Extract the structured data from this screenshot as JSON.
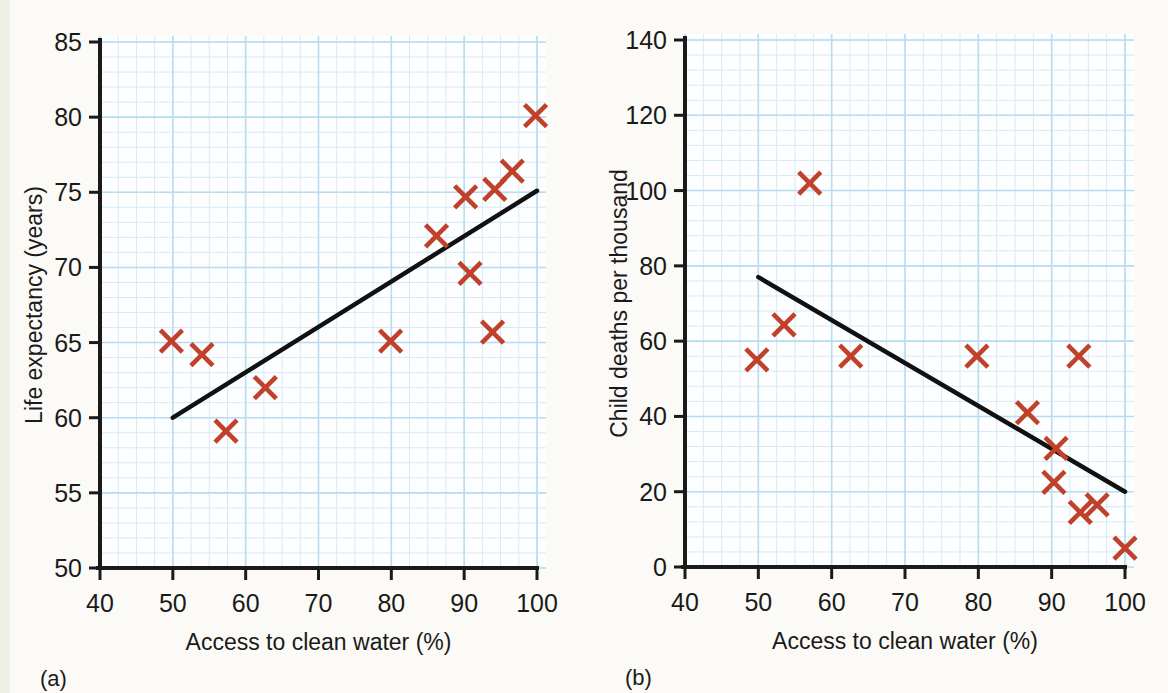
{
  "figure": {
    "background_color": "#fbfaf6",
    "marker_color": "#c0402a",
    "trendline_color": "#111111",
    "grid_minor_color": "#d8e9f4",
    "grid_major_color": "#b9dcef"
  },
  "chart_data": [
    {
      "type": "scatter",
      "panel_label": "(a)",
      "title": "",
      "xlabel": "Access to clean water (%)",
      "ylabel": "Life expectancy (years)",
      "xlim": [
        40,
        100
      ],
      "ylim": [
        50,
        85
      ],
      "xticks": [
        40,
        50,
        60,
        70,
        80,
        90,
        100
      ],
      "yticks": [
        50,
        55,
        60,
        65,
        70,
        75,
        80,
        85
      ],
      "xticklabels": [
        "40",
        "50",
        "60",
        "70",
        "80",
        "90",
        "100"
      ],
      "yticklabels": [
        "50",
        "55",
        "60",
        "65",
        "70",
        "75",
        "80",
        "85"
      ],
      "grid": true,
      "legend": "none",
      "points": [
        {
          "x": 49.8,
          "y": 65.1
        },
        {
          "x": 54.0,
          "y": 64.2
        },
        {
          "x": 57.3,
          "y": 59.1
        },
        {
          "x": 62.7,
          "y": 62.0
        },
        {
          "x": 79.9,
          "y": 65.1
        },
        {
          "x": 86.2,
          "y": 72.1
        },
        {
          "x": 90.2,
          "y": 74.7
        },
        {
          "x": 90.8,
          "y": 69.6
        },
        {
          "x": 93.9,
          "y": 65.7
        },
        {
          "x": 94.2,
          "y": 75.2
        },
        {
          "x": 96.6,
          "y": 76.4
        },
        {
          "x": 99.8,
          "y": 80.1
        }
      ],
      "trendline": {
        "x": [
          50,
          100
        ],
        "y": [
          60.0,
          75.1
        ]
      }
    },
    {
      "type": "scatter",
      "panel_label": "(b)",
      "title": "",
      "xlabel": "Access to clean water (%)",
      "ylabel": "Child deaths per thousand",
      "xlim": [
        40,
        100
      ],
      "ylim": [
        0,
        140
      ],
      "xticks": [
        40,
        50,
        60,
        70,
        80,
        90,
        100
      ],
      "yticks": [
        0,
        20,
        40,
        60,
        80,
        100,
        120,
        140
      ],
      "xticklabels": [
        "40",
        "50",
        "60",
        "70",
        "80",
        "90",
        "100"
      ],
      "yticklabels": [
        "0",
        "20",
        "40",
        "60",
        "80",
        "100",
        "120",
        "140"
      ],
      "grid": true,
      "legend": "none",
      "points": [
        {
          "x": 49.8,
          "y": 55.0
        },
        {
          "x": 53.5,
          "y": 64.3
        },
        {
          "x": 57.0,
          "y": 102.0
        },
        {
          "x": 62.6,
          "y": 56.0
        },
        {
          "x": 79.8,
          "y": 56.0
        },
        {
          "x": 86.7,
          "y": 41.0
        },
        {
          "x": 90.6,
          "y": 31.5
        },
        {
          "x": 90.3,
          "y": 22.5
        },
        {
          "x": 93.7,
          "y": 56.0
        },
        {
          "x": 93.9,
          "y": 14.5
        },
        {
          "x": 96.2,
          "y": 16.5
        },
        {
          "x": 100.0,
          "y": 5.0
        }
      ],
      "trendline": {
        "x": [
          50,
          100
        ],
        "y": [
          77.0,
          20.0
        ]
      }
    }
  ]
}
